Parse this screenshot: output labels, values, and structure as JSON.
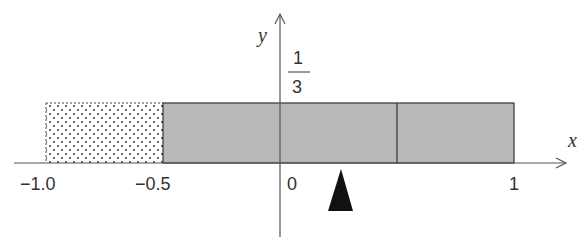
{
  "diagram": {
    "axes": {
      "x_label": "x",
      "y_label": "y"
    },
    "tick_labels": {
      "neg_one": "−1.0",
      "neg_half": "−0.5",
      "zero": "0",
      "one": "1"
    },
    "y_value_label": {
      "numerator": "1",
      "denominator": "3"
    },
    "regions": [
      {
        "name": "dotted-region",
        "x_from": -1.0,
        "x_to": -0.5,
        "fill": "dotted"
      },
      {
        "name": "gray-region-left",
        "x_from": -0.5,
        "x_to": 0,
        "fill": "#b8b8b8"
      },
      {
        "name": "gray-region-middle",
        "x_from": 0,
        "x_to": 0.5,
        "fill": "#b8b8b8"
      },
      {
        "name": "gray-region-right",
        "x_from": 0.5,
        "x_to": 1.0,
        "fill": "#b8b8b8"
      }
    ],
    "height_value": "1/3",
    "pointer": {
      "shape": "black-triangle",
      "x": 0.25
    },
    "colors": {
      "axis": "#555555",
      "gray_fill": "#b9b9b9",
      "outline": "#333333",
      "pointer": "#111111"
    }
  }
}
